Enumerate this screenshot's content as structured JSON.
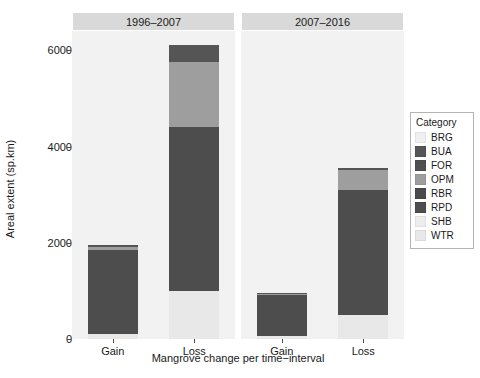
{
  "chart_data": {
    "type": "bar",
    "subtype": "stacked-bar-faceted",
    "title": "",
    "xlabel": "Mangrove change per time−interval",
    "ylabel": "Areal extent (sp.km)",
    "ylim": [
      0,
      6400
    ],
    "yticks": [
      0,
      2000,
      4000,
      6000
    ],
    "ytick_labels": [
      "0",
      "2000",
      "4000",
      "6000"
    ],
    "grid": false,
    "legend_position": "right",
    "legend_title": "Category",
    "categories": [
      "BRG",
      "BUA",
      "FOR",
      "OPM",
      "RBR",
      "RPD",
      "SHB",
      "WTR"
    ],
    "category_colors": {
      "BRG": "#f0f0f0",
      "BUA": "#555555",
      "FOR": "#4f4f4f",
      "OPM": "#9e9e9e",
      "RBR": "#4a4a4a",
      "RPD": "#4d4d4d",
      "SHB": "#ededed",
      "WTR": "#e8e8e8"
    },
    "facets": [
      "1996–2007",
      "2007–2016"
    ],
    "x": [
      "Gain",
      "Loss"
    ],
    "panels": [
      {
        "facet": "1996–2007",
        "bars": [
          {
            "x": "Gain",
            "total": 1960,
            "segments": [
              {
                "category": "WTR",
                "value": 110
              },
              {
                "category": "RPD",
                "value": 1740
              },
              {
                "category": "OPM",
                "value": 60
              },
              {
                "category": "BUA",
                "value": 50
              }
            ]
          },
          {
            "x": "Loss",
            "total": 6120,
            "segments": [
              {
                "category": "WTR",
                "value": 990
              },
              {
                "category": "RPD",
                "value": 3420
              },
              {
                "category": "OPM",
                "value": 1340
              },
              {
                "category": "BUA",
                "value": 370
              }
            ]
          }
        ]
      },
      {
        "facet": "2007–2016",
        "bars": [
          {
            "x": "Gain",
            "total": 960,
            "segments": [
              {
                "category": "WTR",
                "value": 60
              },
              {
                "category": "RPD",
                "value": 860
              },
              {
                "category": "OPM",
                "value": 20
              },
              {
                "category": "BUA",
                "value": 20
              }
            ]
          },
          {
            "x": "Loss",
            "total": 3560,
            "segments": [
              {
                "category": "WTR",
                "value": 500
              },
              {
                "category": "RPD",
                "value": 2600
              },
              {
                "category": "OPM",
                "value": 420
              },
              {
                "category": "BUA",
                "value": 40
              }
            ]
          }
        ]
      }
    ]
  }
}
